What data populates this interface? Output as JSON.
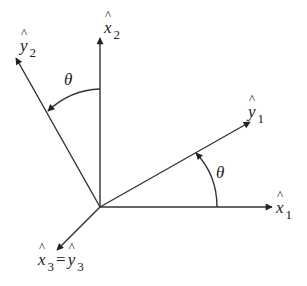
{
  "diagram": {
    "labels": {
      "x1": {
        "base": "x",
        "sub": "1"
      },
      "x2": {
        "base": "x",
        "sub": "2"
      },
      "y1": {
        "base": "y",
        "sub": "1"
      },
      "y2": {
        "base": "y",
        "sub": "2"
      },
      "x3": {
        "base": "x",
        "sub": "3"
      },
      "eq": "=",
      "y3": {
        "base": "y",
        "sub": "3"
      },
      "theta_top": "θ",
      "theta_right": "θ"
    },
    "colors": {
      "line": "#333333",
      "text": "#222222"
    }
  }
}
